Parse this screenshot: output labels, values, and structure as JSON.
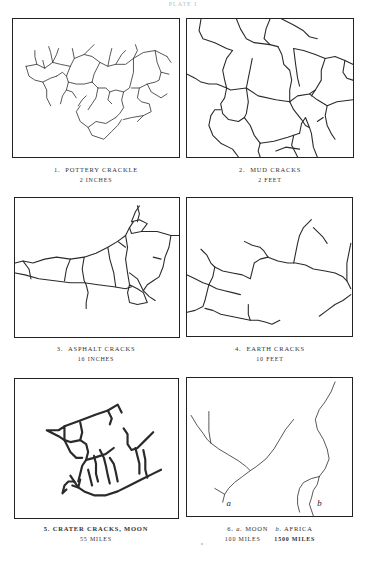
{
  "header": {
    "text": "PLATE I"
  },
  "figures": [
    {
      "number": "1.",
      "title": "POTTERY CRACKLE",
      "scale": "2 INCHES"
    },
    {
      "number": "2.",
      "title": "MUD CRACKS",
      "scale": "2 FEET"
    },
    {
      "number": "3.",
      "title": "ASPHALT CRACKS",
      "scale": "16 INCHES"
    },
    {
      "number": "4.",
      "title": "EARTH CRACKS",
      "scale": "10 FEET"
    },
    {
      "number": "5.",
      "title": "CRATER CRACKS, MOON",
      "scale": "55 MILES"
    },
    {
      "number": "6.",
      "title_a_letter": "a.",
      "title_a": "MOON",
      "title_b_letter": "b.",
      "title_b": "AFRICA",
      "scale_a": "100 MILES",
      "scale_b": "1500 MILES",
      "label_a": "a",
      "label_b": "b"
    }
  ]
}
